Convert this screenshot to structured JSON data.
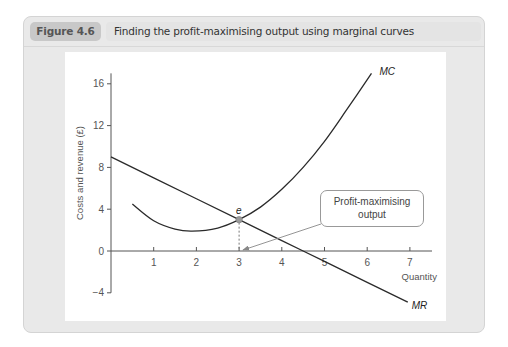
{
  "figure": {
    "label": "Figure 4.6",
    "title": "Finding the profit-maximising output using marginal curves"
  },
  "callout": {
    "line1": "Profit-maximising",
    "line2": "output"
  },
  "point_label": "e",
  "colors": {
    "card_bg": "#e9e9e9",
    "label_pill": "#c8c8c8",
    "title_bar": "#e4e4e4",
    "curve": "#2a2a2a",
    "axis": "#555555",
    "point": "#9a9a9a"
  },
  "chart_data": {
    "type": "line",
    "title": "Finding the profit-maximising output using marginal curves",
    "xlabel": "Quantity",
    "ylabel": "Costs and revenue (£)",
    "xlim": [
      0,
      7.5
    ],
    "ylim": [
      -4,
      17
    ],
    "x_ticks": [
      1,
      2,
      3,
      4,
      5,
      6,
      7
    ],
    "y_ticks": [
      -4,
      0,
      4,
      8,
      12,
      16
    ],
    "grid": false,
    "legend": "none (curves labelled directly)",
    "series": [
      {
        "name": "MC",
        "x": [
          0.5,
          1.0,
          1.5,
          1.9,
          2.5,
          3.0,
          3.5,
          4.0,
          4.5,
          5.0,
          5.5,
          6.1
        ],
        "y": [
          4.5,
          2.9,
          2.1,
          1.9,
          2.2,
          3.0,
          4.2,
          5.9,
          8.0,
          10.5,
          13.4,
          17.0
        ]
      },
      {
        "name": "MR",
        "x": [
          0,
          1,
          2,
          3,
          4,
          4.5,
          5,
          6,
          6.95
        ],
        "y": [
          9,
          7,
          5,
          3,
          1,
          0,
          -1,
          -3,
          -4.9
        ]
      }
    ],
    "annotations": [
      {
        "text": "e",
        "x": 3,
        "y": 3,
        "note": "MC = MR intersection, dashed drop line to x=3"
      },
      {
        "text": "Profit-maximising output",
        "points_to": {
          "x": 3,
          "y": 0
        }
      }
    ]
  }
}
